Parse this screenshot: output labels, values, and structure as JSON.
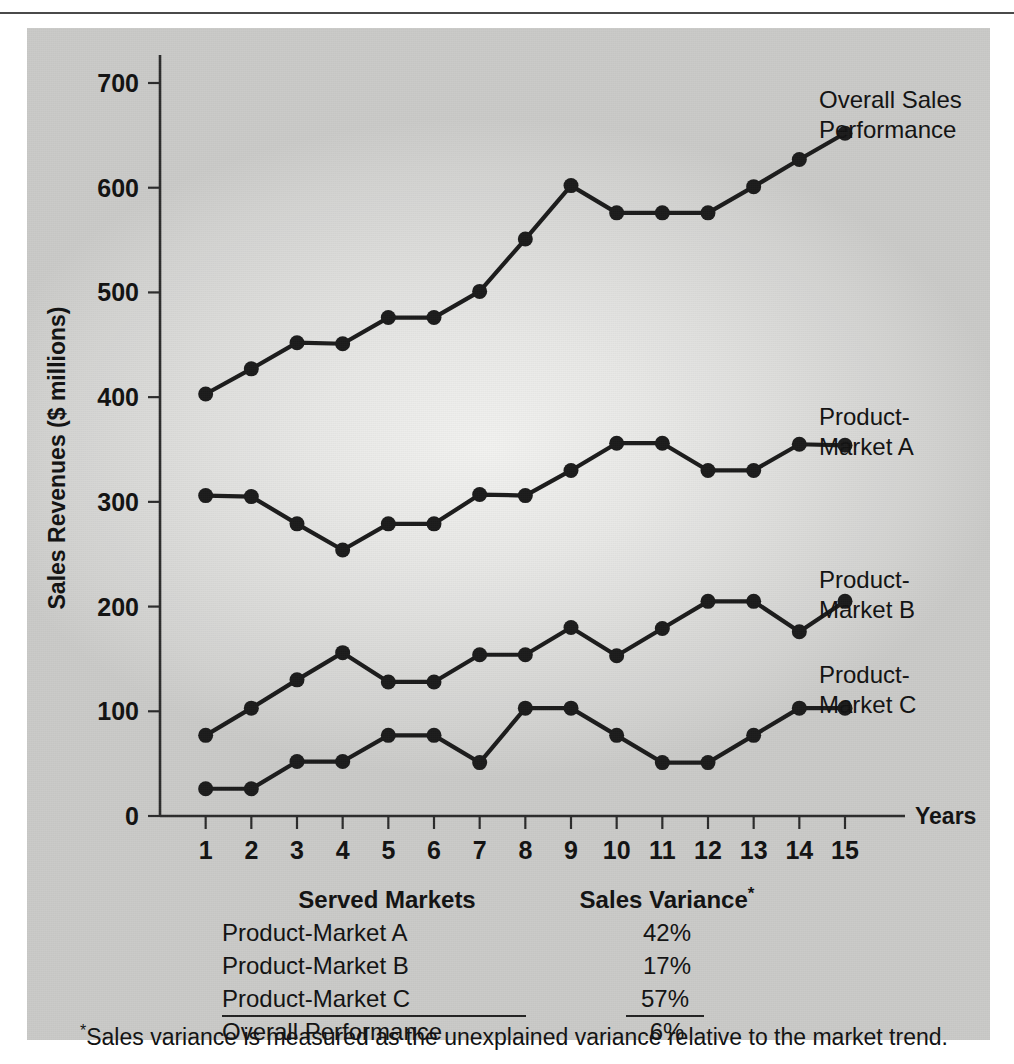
{
  "figure": {
    "ylabel": "Sales Revenues ($ millions)",
    "xlabel": "Years"
  },
  "series_labels": {
    "overall_line1": "Overall Sales",
    "overall_line2": "Performance",
    "a_line1": "Product-",
    "a_line2": "Market A",
    "b_line1": "Product-",
    "b_line2": "Market B",
    "c_line1": "Product-",
    "c_line2": "Market C"
  },
  "table": {
    "header": {
      "markets": "Served Markets",
      "variance": "Sales Variance",
      "variance_marker": "*"
    },
    "rows": [
      {
        "market": "Product-Market A",
        "variance": "42%"
      },
      {
        "market": "Product-Market B",
        "variance": "17%"
      },
      {
        "market": "Product-Market C",
        "variance": "57%"
      },
      {
        "market": "Overall Performance",
        "variance": "6%"
      }
    ]
  },
  "footnote": {
    "marker": "*",
    "text": "Sales variance is measured as the unexplained variance relative to the market trend."
  },
  "axis": {
    "y_ticks": [
      "0",
      "100",
      "200",
      "300",
      "400",
      "500",
      "600",
      "700"
    ],
    "x_ticks": [
      "1",
      "2",
      "3",
      "4",
      "5",
      "6",
      "7",
      "8",
      "9",
      "10",
      "11",
      "12",
      "13",
      "14",
      "15"
    ]
  },
  "colors": {
    "ink": "#1a1a1a",
    "panel_light": "#f2f2f0",
    "panel_dark": "#cacac8"
  },
  "chart_data": {
    "type": "line",
    "title": "",
    "xlabel": "Years",
    "ylabel": "Sales Revenues ($ millions)",
    "xlim": [
      0,
      15
    ],
    "ylim": [
      0,
      700
    ],
    "grid": false,
    "legend": "inline-right-labels",
    "categories": [
      1,
      2,
      3,
      4,
      5,
      6,
      7,
      8,
      9,
      10,
      11,
      12,
      13,
      14,
      15
    ],
    "series": [
      {
        "name": "Overall Sales Performance",
        "values": [
          403,
          427,
          452,
          451,
          476,
          476,
          501,
          551,
          602,
          576,
          576,
          576,
          601,
          627,
          652
        ]
      },
      {
        "name": "Product-Market A",
        "values": [
          306,
          305,
          279,
          254,
          279,
          279,
          307,
          306,
          330,
          356,
          356,
          330,
          330,
          355,
          354
        ]
      },
      {
        "name": "Product-Market B",
        "values": [
          77,
          103,
          130,
          156,
          128,
          128,
          154,
          154,
          180,
          153,
          179,
          205,
          205,
          176,
          205
        ]
      },
      {
        "name": "Product-Market C",
        "values": [
          26,
          26,
          52,
          52,
          77,
          77,
          51,
          103,
          103,
          77,
          51,
          51,
          77,
          103,
          103
        ]
      }
    ],
    "annotations": {
      "variance_table": {
        "Product-Market A": "42%",
        "Product-Market B": "17%",
        "Product-Market C": "57%",
        "Overall Performance": "6%"
      }
    }
  }
}
